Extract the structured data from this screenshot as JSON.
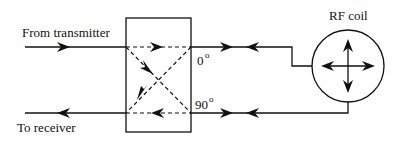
{
  "diagram": {
    "type": "quadrature-hybrid-rf-coil-schematic",
    "labels": {
      "input": "From transmitter",
      "output": "To receiver",
      "port_0": "0",
      "port_90": "90",
      "degree_symbol": "o",
      "coil": "RF coil"
    },
    "colors": {
      "line": "#111111",
      "background": "#ffffff"
    },
    "components": [
      {
        "id": "hybrid-box",
        "kind": "quadrature hybrid coupler"
      },
      {
        "id": "rf-coil",
        "kind": "circle with four-way arrows"
      }
    ],
    "connections": [
      {
        "from": "transmitter",
        "to": "hybrid-box",
        "arrow": "right"
      },
      {
        "from": "hybrid-box",
        "to": "receiver",
        "arrow": "left"
      },
      {
        "from": "hybrid-0-port",
        "to": "rf-coil",
        "arrows": [
          "right",
          "left"
        ]
      },
      {
        "from": "hybrid-90-port",
        "to": "rf-coil",
        "arrows": [
          "right",
          "left"
        ]
      }
    ]
  }
}
